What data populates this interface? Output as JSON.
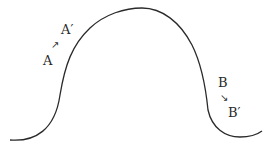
{
  "diagram": {
    "curve_color": "#2a2a2a",
    "labels": {
      "a": "A",
      "a_prime": "A′",
      "a_arrow": "↗",
      "b": "B",
      "b_prime": "B′",
      "b_arrow": "↘"
    }
  }
}
